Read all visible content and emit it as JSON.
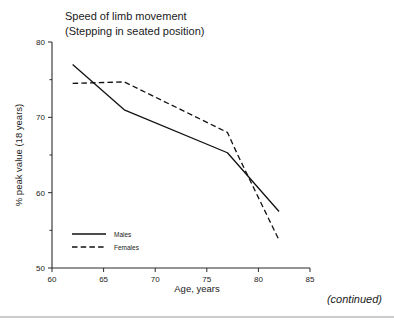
{
  "figure": {
    "continued_note": "(continued)"
  },
  "chart_data": {
    "type": "line",
    "title": "Speed of limb movement",
    "subtitle": "(Stepping in seated position)",
    "xlabel": "Age, years",
    "ylabel": "% peak value (18 years)",
    "xlim": [
      60,
      85
    ],
    "ylim": [
      50,
      80
    ],
    "xticks": [
      60,
      65,
      70,
      75,
      80,
      85
    ],
    "xtick_labels": [
      "60",
      "65",
      "70",
      "75",
      "80",
      "85"
    ],
    "yticks": [
      50,
      60,
      70,
      80
    ],
    "ytick_labels": [
      "50",
      "60",
      "70",
      "80"
    ],
    "yminorticks": [
      55,
      65,
      75
    ],
    "grid": false,
    "legend_position": "lower left",
    "series": [
      {
        "name": "Males",
        "style": "solid",
        "color": "#111111",
        "x": [
          62,
          67,
          77,
          82
        ],
        "values": [
          77.0,
          71.0,
          65.3,
          57.5
        ]
      },
      {
        "name": "Females",
        "style": "dashed",
        "color": "#111111",
        "x": [
          62,
          67,
          77,
          78,
          82
        ],
        "values": [
          74.5,
          74.7,
          68.0,
          65.0,
          53.7
        ]
      }
    ]
  }
}
